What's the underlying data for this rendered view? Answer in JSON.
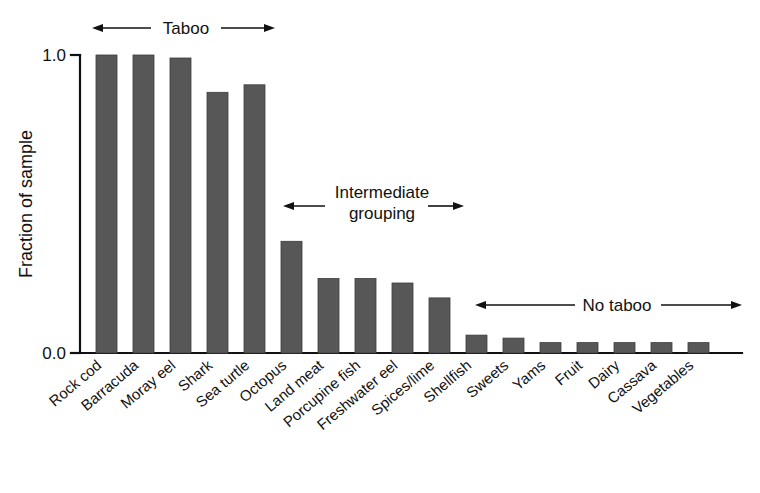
{
  "chart_data": {
    "type": "bar",
    "title": "",
    "subtitle": "",
    "xlabel": "",
    "ylabel": "Fraction of sample",
    "ylim": [
      0.0,
      1.0
    ],
    "yticks": [
      0.0,
      1.0
    ],
    "ytick_labels": [
      "0.0",
      "1.0"
    ],
    "grid": false,
    "legend": null,
    "bar_color": "#575757",
    "axis_color": "#111111",
    "categories": [
      "Rock cod",
      "Barracuda",
      "Moray eel",
      "Shark",
      "Sea turtle",
      "Octopus",
      "Land meat",
      "Porcupine fish",
      "Freshwater eel",
      "Spices/lime",
      "Shellfish",
      "Sweets",
      "Yams",
      "Fruit",
      "Dairy",
      "Cassava",
      "Vegetables"
    ],
    "values": [
      1.0,
      1.0,
      0.99,
      0.875,
      0.9,
      0.375,
      0.25,
      0.25,
      0.235,
      0.185,
      0.06,
      0.05,
      0.035,
      0.035,
      0.035,
      0.035,
      0.035
    ],
    "annotations": [
      {
        "id": "taboo",
        "label": "Taboo",
        "arrow": "double",
        "covers": [
          "Rock cod",
          "Sea turtle"
        ]
      },
      {
        "id": "intermediate",
        "label_line1": "Intermediate",
        "label_line2": "grouping",
        "arrow": "double",
        "covers": [
          "Octopus",
          "Spices/lime"
        ]
      },
      {
        "id": "no-taboo",
        "label": "No taboo",
        "arrow": "double",
        "covers": [
          "Shellfish",
          "Vegetables"
        ]
      }
    ]
  },
  "axis": {
    "y_title": "Fraction of sample",
    "y_tick_top": "1.0",
    "y_tick_bottom": "0.0"
  },
  "annotations": {
    "taboo": "Taboo",
    "intermediate_line1": "Intermediate",
    "intermediate_line2": "grouping",
    "no_taboo": "No taboo"
  },
  "categories": {
    "c0": "Rock cod",
    "c1": "Barracuda",
    "c2": "Moray eel",
    "c3": "Shark",
    "c4": "Sea turtle",
    "c5": "Octopus",
    "c6": "Land meat",
    "c7": "Porcupine fish",
    "c8": "Freshwater eel",
    "c9": "Spices/lime",
    "c10": "Shellfish",
    "c11": "Sweets",
    "c12": "Yams",
    "c13": "Fruit",
    "c14": "Dairy",
    "c15": "Cassava",
    "c16": "Vegetables"
  }
}
